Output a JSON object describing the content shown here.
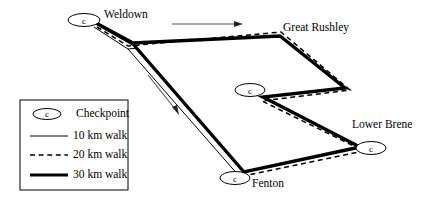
{
  "figure": {
    "width": 431,
    "height": 202,
    "background_color": "#ffffff",
    "line_color": "#000000"
  },
  "places": [
    {
      "name": "Weldown",
      "label": "Weldown",
      "checkpoint_letter": "c",
      "label_x": 104,
      "label_y": 9,
      "cp_cx": 84,
      "cp_cy": 20,
      "cp_rx": 16,
      "cp_ry": 6.5
    },
    {
      "name": "Great Rushley",
      "label": "Great Rushley",
      "checkpoint_letter": "",
      "label_x": 283,
      "label_y": 22,
      "cp_cx": 0,
      "cp_cy": 0,
      "cp_rx": 0,
      "cp_ry": 0
    },
    {
      "name": "Mid Checkpoint",
      "label": "",
      "checkpoint_letter": "c",
      "label_x": 0,
      "label_y": 0,
      "cp_cx": 250,
      "cp_cy": 90,
      "cp_rx": 15,
      "cp_ry": 6.5
    },
    {
      "name": "Lower Brene",
      "label": "Lower Brene",
      "checkpoint_letter": "c",
      "label_x": 352,
      "label_y": 119,
      "cp_cx": 371,
      "cp_cy": 148,
      "cp_rx": 15,
      "cp_ry": 6.5
    },
    {
      "name": "Fenton",
      "label": "Fenton",
      "checkpoint_letter": "c",
      "label_x": 250,
      "label_y": 177,
      "cp_cx": 235,
      "cp_cy": 178,
      "cp_rx": 15,
      "cp_ry": 6.5
    }
  ],
  "legend": {
    "box": {
      "x": 20,
      "y": 100,
      "width": 108,
      "height": 90
    },
    "items": [
      {
        "key": "checkpoint",
        "label": "Checkpoint",
        "symbol": "ellipse-c",
        "letter": "c"
      },
      {
        "key": "walk10",
        "label": "10 km walk",
        "symbol": "thin-solid",
        "letter": ""
      },
      {
        "key": "walk20",
        "label": "20 km walk",
        "symbol": "dashed",
        "letter": ""
      },
      {
        "key": "walk30",
        "label": "30 km walk",
        "symbol": "thick-solid",
        "letter": ""
      }
    ]
  },
  "routes": [
    {
      "key": "walk10",
      "label": "10 km walk",
      "style": "thin-solid",
      "stroke_width": 1,
      "description": "Weldown to the junction, then south-east down to Fenton"
    },
    {
      "key": "walk20",
      "label": "20 km walk",
      "style": "dashed",
      "stroke_width": 1.4,
      "description": "Weldown east to Great Rushley, down to the mid checkpoint, out to Lower Brene and back west to Fenton"
    },
    {
      "key": "walk30",
      "label": "30 km walk",
      "style": "thick-solid",
      "stroke_width": 3.2,
      "description": "Full circuit: Weldown, Great Rushley, mid checkpoint, Lower Brene, Fenton"
    }
  ],
  "arrows": [
    {
      "name": "direction-arrow-top",
      "x1": 172,
      "y1": 24,
      "x2": 242,
      "y2": 24
    },
    {
      "name": "direction-arrow-diagonal",
      "x1": 148,
      "y1": 75,
      "x2": 179,
      "y2": 114
    }
  ]
}
